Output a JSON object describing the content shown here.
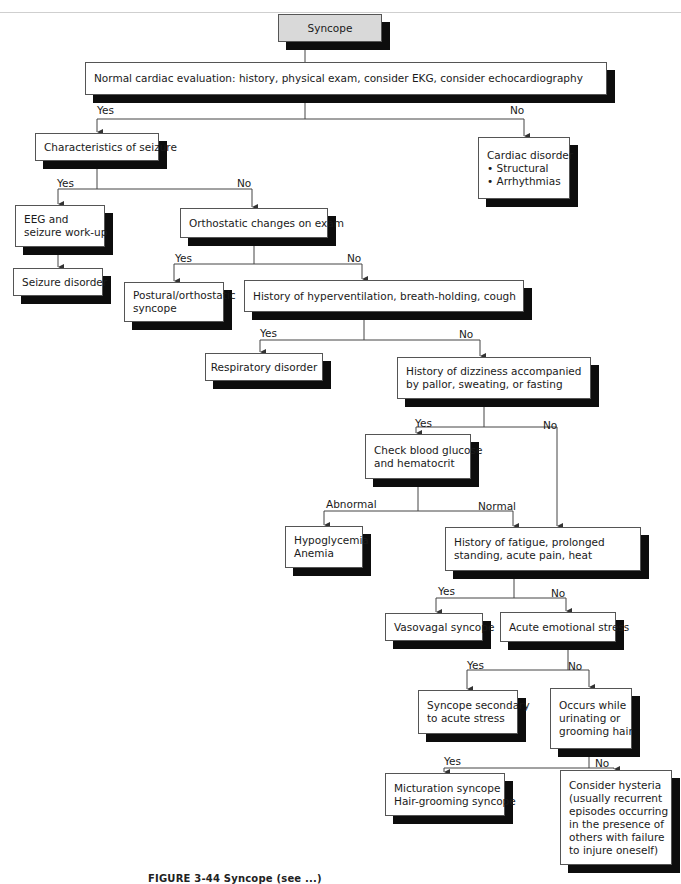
{
  "figure": {
    "caption": "FIGURE 3-44  Syncope (see ...)"
  },
  "nodes": {
    "syncope": {
      "lines": [
        "Syncope"
      ]
    },
    "cardiac_eval": {
      "lines": [
        "Normal cardiac evaluation: history, physical exam, consider EKG, consider echocardiography"
      ]
    },
    "seizure_char": {
      "lines": [
        "Characteristics of seizure"
      ]
    },
    "cardiac_disorder": {
      "lines": [
        "Cardiac disorder",
        "• Structural",
        "• Arrhythmias"
      ]
    },
    "eeg": {
      "lines": [
        "EEG and",
        "seizure work-up"
      ]
    },
    "orthostatic": {
      "lines": [
        "Orthostatic changes on exam"
      ]
    },
    "seizure_disorder": {
      "lines": [
        "Seizure disorder"
      ]
    },
    "postural": {
      "lines": [
        "Postural/orthostatic",
        "syncope"
      ]
    },
    "hyperventilation": {
      "lines": [
        "History of hyperventilation, breath-holding, cough"
      ]
    },
    "respiratory": {
      "lines": [
        "Respiratory disorder"
      ]
    },
    "dizziness": {
      "lines": [
        "History of dizziness accompanied",
        "by pallor, sweating, or fasting"
      ]
    },
    "glucose": {
      "lines": [
        "Check blood glucose",
        "and hematocrit"
      ]
    },
    "hypoglycemia": {
      "lines": [
        "Hypoglycemia",
        "Anemia"
      ]
    },
    "fatigue": {
      "lines": [
        "History of fatigue, prolonged",
        "standing, acute pain, heat"
      ]
    },
    "vasovagal": {
      "lines": [
        "Vasovagal syncope"
      ]
    },
    "emotional": {
      "lines": [
        "Acute emotional stress"
      ]
    },
    "secondary": {
      "lines": [
        "Syncope secondary",
        "to acute stress"
      ]
    },
    "urinating": {
      "lines": [
        "Occurs while",
        "urinating or",
        "grooming hair"
      ]
    },
    "micturation": {
      "lines": [
        "Micturation syncope",
        "Hair-grooming syncope"
      ]
    },
    "hysteria": {
      "lines": [
        "Consider hysteria",
        "(usually recurrent",
        "episodes occurring",
        "in the presence of",
        "others with failure",
        "to injure oneself)"
      ]
    }
  },
  "edge_labels": {
    "cardiac_yes": "Yes",
    "cardiac_no": "No",
    "seizure_yes": "Yes",
    "seizure_no": "No",
    "ortho_yes": "Yes",
    "ortho_no": "No",
    "hyper_yes": "Yes",
    "hyper_no": "No",
    "dizzy_yes": "Yes",
    "dizzy_no": "No",
    "glucose_abnormal": "Abnormal",
    "glucose_normal": "Normal",
    "fatigue_yes": "Yes",
    "fatigue_no": "No",
    "emotional_yes": "Yes",
    "emotional_no": "No",
    "urinating_yes": "Yes",
    "urinating_no": "No"
  },
  "colors": {
    "box_border": "#555555",
    "shadow": "#0d0d0d",
    "root_fill": "#d9d9d9",
    "line": "#444444"
  }
}
